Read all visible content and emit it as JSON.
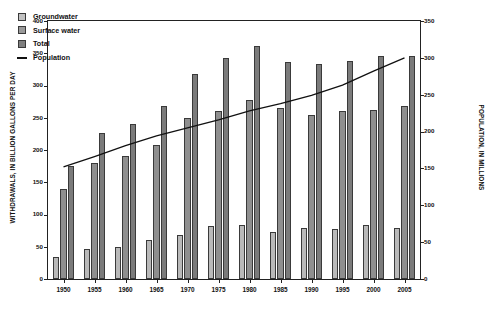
{
  "chart_data": {
    "type": "bar",
    "title": "",
    "categories": [
      "1950",
      "1955",
      "1960",
      "1965",
      "1970",
      "1975",
      "1980",
      "1985",
      "1990",
      "1995",
      "2000",
      "2005"
    ],
    "series": [
      {
        "name": "Groundwater",
        "axis": "left",
        "values": [
          34,
          47,
          50,
          60,
          68,
          82,
          83,
          73,
          79,
          77,
          83,
          79
        ]
      },
      {
        "name": "Surface water",
        "axis": "left",
        "values": [
          140,
          180,
          190,
          208,
          250,
          260,
          278,
          265,
          255,
          261,
          262,
          268
        ]
      },
      {
        "name": "Total",
        "axis": "left",
        "values": [
          175,
          227,
          240,
          269,
          318,
          342,
          361,
          337,
          334,
          338,
          345,
          345
        ]
      },
      {
        "name": "Population",
        "axis": "right",
        "type": "line",
        "values": [
          152,
          166,
          181,
          194,
          205,
          216,
          228,
          238,
          249,
          263,
          282,
          300
        ]
      }
    ],
    "xlabel": "",
    "ylabel": "WITHDRAWALS, IN BILLION GALLONS PER DAY",
    "y2label": "POPULATION, IN MILLIONS",
    "ylim": [
      0,
      400
    ],
    "y2lim": [
      0,
      350
    ],
    "yticks": [
      0,
      50,
      100,
      150,
      200,
      250,
      300,
      350,
      400
    ],
    "y2ticks": [
      0,
      50,
      100,
      150,
      200,
      250,
      300,
      350
    ],
    "grid": false,
    "legend_position": "top-left",
    "colors": {
      "groundwater": "#c2c2c2",
      "surface_water": "#9a9a9a",
      "total": "#7f7f7f",
      "population_line": "#111111",
      "axis": "#222222",
      "background": "#ffffff"
    }
  },
  "axes": {
    "left_title": "WITHDRAWALS, IN BILLION GALLONS PER DAY",
    "right_title": "POPULATION, IN MILLIONS",
    "left_ticks": [
      "0",
      "50",
      "100",
      "150",
      "200",
      "250",
      "300",
      "350",
      "400"
    ],
    "right_ticks": [
      "0",
      "50",
      "100",
      "150",
      "200",
      "250",
      "300",
      "350"
    ],
    "x_ticks": [
      "1950",
      "1955",
      "1960",
      "1965",
      "1970",
      "1975",
      "1980",
      "1985",
      "1990",
      "1995",
      "2000",
      "2005"
    ]
  },
  "legend": {
    "items": [
      {
        "label": "Groundwater",
        "kind": "swatch",
        "class": "gw"
      },
      {
        "label": "Surface water",
        "kind": "swatch",
        "class": "sw"
      },
      {
        "label": "Total",
        "kind": "swatch",
        "class": "tot"
      },
      {
        "label": "Population",
        "kind": "line",
        "class": "pop"
      }
    ]
  }
}
